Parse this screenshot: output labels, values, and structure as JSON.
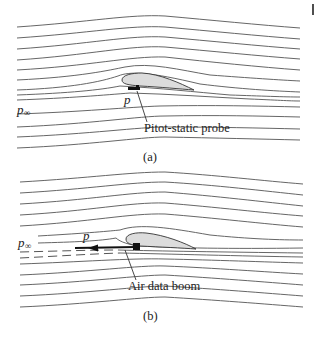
{
  "figure": {
    "panels": [
      {
        "id": "a",
        "caption": "(a)",
        "freestream_label": "p",
        "freestream_subscript": "∞",
        "local_pressure_label": "p",
        "callout": "Pitot-static probe",
        "colors": {
          "streamline": "#555555",
          "airfoil_fill": "#dcdcdc",
          "probe": "#111111"
        }
      },
      {
        "id": "b",
        "caption": "(b)",
        "freestream_label": "p",
        "freestream_subscript": "∞",
        "local_pressure_label": "p",
        "callout": "Air data boom",
        "colors": {
          "streamline": "#555555",
          "airfoil_fill": "#dcdcdc",
          "boom": "#111111"
        }
      }
    ],
    "corner_mark": "|"
  }
}
